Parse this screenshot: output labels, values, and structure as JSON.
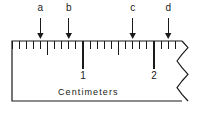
{
  "figure": {
    "type": "ruler-diagram",
    "caption": "Centimeters",
    "units": "cm",
    "line_color": "#1a1a1a",
    "background_color": "#ffffff"
  },
  "ruler": {
    "origin_cm": 0,
    "visible_end_cm": 2.4,
    "torn_right_edge": true,
    "numbered_ticks": [
      {
        "label": "1",
        "value_cm": 1
      },
      {
        "label": "2",
        "value_cm": 2
      }
    ],
    "minor_tick_interval_cm": 0.1,
    "half_tick_interval_cm": 0.5
  },
  "pointers": [
    {
      "label": "a",
      "value_cm": 0.4
    },
    {
      "label": "b",
      "value_cm": 0.8
    },
    {
      "label": "c",
      "value_cm": 1.7
    },
    {
      "label": "d",
      "value_cm": 2.2
    }
  ],
  "geometry": {
    "ruler_left_px": 12,
    "ruler_top_px": 41,
    "ruler_bottom_px": 101,
    "ruler_right_px": 182,
    "px_per_cm": 71,
    "minor_tick_len_px": 8,
    "half_tick_len_px": 14,
    "major_tick_len_px": 28,
    "arrow_top_px": 18,
    "arrow_bottom_px": 39,
    "label_top_px": 3,
    "number_top_px": 71,
    "caption_left_px": 58,
    "caption_top_px": 88
  }
}
